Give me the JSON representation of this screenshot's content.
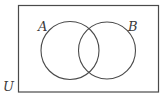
{
  "diagram": {
    "type": "venn",
    "universe": {
      "label": "U",
      "stroke": "#4a4a4a"
    },
    "sets": [
      {
        "label": "A",
        "stroke": "#4a4a4a"
      },
      {
        "label": "B",
        "stroke": "#4a4a4a"
      }
    ]
  }
}
